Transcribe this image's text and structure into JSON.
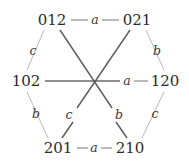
{
  "figure": {
    "type": "cayley-graph",
    "background_color": "#ffffff",
    "node_text_color": "#2b2b2b",
    "outer_edge_color": "#b9b9b9",
    "inner_edge_color": "#5a5a5a",
    "horizontal_edge_color": "#8c8c8c"
  },
  "nodes": [
    {
      "id": "n-012",
      "label": "012",
      "x": 52,
      "y": 20
    },
    {
      "id": "n-021",
      "label": "021",
      "x": 137,
      "y": 20
    },
    {
      "id": "n-102",
      "label": "102",
      "x": 26,
      "y": 81
    },
    {
      "id": "n-120",
      "label": "120",
      "x": 165,
      "y": 81
    },
    {
      "id": "n-201",
      "label": "201",
      "x": 58,
      "y": 148
    },
    {
      "id": "n-210",
      "label": "210",
      "x": 130,
      "y": 148
    }
  ],
  "edges": [
    {
      "id": "e-012-021",
      "from": "012",
      "to": "021",
      "label": "a",
      "label_x": 95,
      "label_y": 20,
      "style": "horizontal"
    },
    {
      "id": "e-201-210",
      "from": "201",
      "to": "210",
      "label": "a",
      "label_x": 94,
      "label_y": 148,
      "style": "horizontal"
    },
    {
      "id": "e-102-120",
      "from": "102",
      "to": "120",
      "label": "a",
      "label_x": 127,
      "label_y": 81,
      "style": "through-center"
    },
    {
      "id": "e-012-102",
      "from": "012",
      "to": "102",
      "label": "c",
      "label_x": 33,
      "label_y": 51,
      "style": "outer"
    },
    {
      "id": "e-021-120",
      "from": "021",
      "to": "120",
      "label": "b",
      "label_x": 157,
      "label_y": 51,
      "style": "outer"
    },
    {
      "id": "e-102-201",
      "from": "102",
      "to": "201",
      "label": "b",
      "label_x": 36,
      "label_y": 114,
      "style": "outer"
    },
    {
      "id": "e-120-210",
      "from": "120",
      "to": "210",
      "label": "c",
      "label_x": 155,
      "label_y": 114,
      "style": "outer"
    },
    {
      "id": "e-021-201",
      "from": "021",
      "to": "201",
      "label": "c",
      "label_x": 69,
      "label_y": 115,
      "style": "through-center"
    },
    {
      "id": "e-012-210",
      "from": "012",
      "to": "210",
      "label": "b",
      "label_x": 119,
      "label_y": 115,
      "style": "through-center"
    }
  ]
}
